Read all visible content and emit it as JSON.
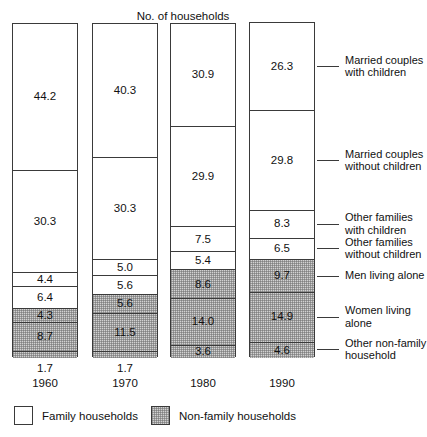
{
  "chart_data": {
    "type": "bar",
    "title": "No. of households",
    "subtitle": "",
    "xlabel": "",
    "ylabel": "",
    "stacked": true,
    "orientation": "vertical",
    "grid": false,
    "legend_position": "bottom-left",
    "units": "millions of households",
    "categories": [
      "1960",
      "1970",
      "1980",
      "1990"
    ],
    "column_totals_label": [
      "53 million",
      "63 million",
      "81 million",
      "93 million"
    ],
    "column_totals": [
      53,
      63,
      81,
      93
    ],
    "series": [
      {
        "name": "Married couples with children",
        "group": "Family households",
        "shaded": false,
        "values": [
          44.2,
          40.3,
          30.9,
          26.3
        ]
      },
      {
        "name": "Married couples without children",
        "group": "Family households",
        "shaded": false,
        "values": [
          30.3,
          30.3,
          29.9,
          29.8
        ]
      },
      {
        "name": "Other families with children",
        "group": "Family households",
        "shaded": false,
        "values": [
          4.4,
          5.0,
          7.5,
          8.3
        ]
      },
      {
        "name": "Other families without children",
        "group": "Family households",
        "shaded": false,
        "values": [
          6.4,
          5.6,
          5.4,
          6.5
        ]
      },
      {
        "name": "Men living alone",
        "group": "Non-family households",
        "shaded": true,
        "values": [
          4.3,
          5.6,
          8.6,
          9.7
        ]
      },
      {
        "name": "Women living alone",
        "group": "Non-family households",
        "shaded": true,
        "values": [
          8.7,
          11.5,
          14.0,
          14.9
        ]
      },
      {
        "name": "Other non-family household",
        "group": "Non-family households",
        "shaded": true,
        "values": [
          1.7,
          1.7,
          3.6,
          4.6
        ]
      }
    ],
    "legend": [
      {
        "label": "Family households",
        "shaded": false
      },
      {
        "label": "Non-family households",
        "shaded": true
      }
    ],
    "category_labels": [
      "Married couples\nwith children",
      "Married couples\nwithout children",
      "Other families\nwith children",
      "Other families\nwithout children",
      "Men living alone",
      "Women living\nalone",
      "Other non-family\nhousehold"
    ]
  }
}
